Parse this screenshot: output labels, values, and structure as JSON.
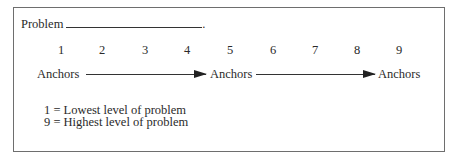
{
  "problem": {
    "label": "Problem",
    "terminator": "."
  },
  "scale": {
    "points": [
      "1",
      "2",
      "3",
      "4",
      "5",
      "6",
      "7",
      "8",
      "9"
    ],
    "positions_px": [
      61,
      102,
      145,
      187,
      230,
      273,
      315,
      357,
      399
    ]
  },
  "anchors": [
    {
      "label": "Anchors"
    },
    {
      "label": "Anchors"
    },
    {
      "label": "Anchors"
    }
  ],
  "legend": [
    {
      "text": "1 = Lowest level of problem"
    },
    {
      "text": "9 = Highest level of problem"
    }
  ]
}
